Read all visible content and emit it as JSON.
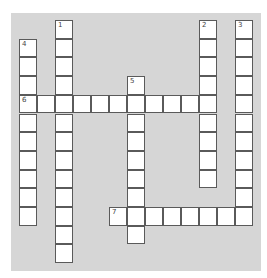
{
  "puzzle": {
    "type": "crossword",
    "rows": 13,
    "cols": 13,
    "colors": {
      "board": "#d6d6d6",
      "cell": "#ffffff",
      "border": "#5a5a5a",
      "number": "#444444"
    },
    "words": [
      {
        "number": "1",
        "direction": "down",
        "row": 0,
        "col": 2,
        "length": 13
      },
      {
        "number": "2",
        "direction": "down",
        "row": 0,
        "col": 10,
        "length": 9
      },
      {
        "number": "3",
        "direction": "down",
        "row": 0,
        "col": 12,
        "length": 11
      },
      {
        "number": "4",
        "direction": "down",
        "row": 1,
        "col": 0,
        "length": 10
      },
      {
        "number": "5",
        "direction": "down",
        "row": 3,
        "col": 6,
        "length": 9
      },
      {
        "number": "6",
        "direction": "across",
        "row": 4,
        "col": 0,
        "length": 11
      },
      {
        "number": "7",
        "direction": "across",
        "row": 10,
        "col": 5,
        "length": 8
      }
    ]
  }
}
